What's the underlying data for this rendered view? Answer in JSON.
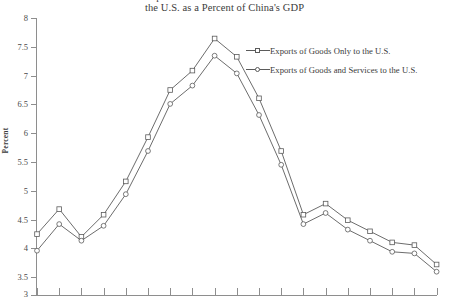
{
  "chart_data": {
    "type": "line",
    "title": "China's Exports of Goods and Goods-and-Services to\nthe U.S. as a Percent of China's GDP",
    "title_line1": "China's Exports of Goods and Goods-and-Services to",
    "title_line2": "the U.S. as a Percent of China's GDP",
    "xlabel": "",
    "ylabel": "Percent",
    "ylim": [
      3,
      8
    ],
    "ytick_labels": [
      "8",
      "7.5",
      "7",
      "6.5",
      "6",
      "5.5",
      "5",
      "4.5",
      "4",
      "3.5",
      "3"
    ],
    "yticks": [
      8,
      7.5,
      7,
      6.5,
      6,
      5.5,
      5,
      4.5,
      4,
      3.5,
      3
    ],
    "xtick_labels": [
      "",
      "",
      "",
      "",
      "",
      "",
      "",
      "",
      "",
      "",
      "",
      "",
      "",
      "",
      "",
      "",
      "",
      "",
      ""
    ],
    "grid": false,
    "legend_position": "upper right",
    "x_count": 19,
    "series": [
      {
        "name": "Exports of Goods Only to the U.S.",
        "marker": "open-square",
        "color": "#5b5b5b",
        "values": [
          4.1,
          4.55,
          4.05,
          4.45,
          5.05,
          5.85,
          6.7,
          7.05,
          7.63,
          7.3,
          6.55,
          5.6,
          4.45,
          4.65,
          4.35,
          4.15,
          3.95,
          3.9,
          3.55
        ]
      },
      {
        "name": "Exports of Goods and Services to the U.S.",
        "marker": "open-circle",
        "color": "#5b5b5b",
        "values": [
          3.8,
          4.28,
          3.98,
          4.25,
          4.82,
          5.6,
          6.45,
          6.78,
          7.32,
          7.0,
          6.25,
          5.35,
          4.28,
          4.48,
          4.18,
          3.98,
          3.78,
          3.75,
          3.42
        ]
      }
    ]
  },
  "legend": {
    "items": [
      {
        "label": "Exports of Goods Only to the U.S."
      },
      {
        "label": "Exports of Goods and Services to the U.S."
      }
    ]
  },
  "colors": {
    "axis": "#8e8e8e",
    "series": "#5b5b5b",
    "text": "#3a3a3a",
    "background": "#ffffff"
  }
}
